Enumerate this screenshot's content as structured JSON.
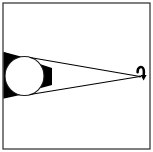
{
  "figure": {
    "frame": {
      "x": 3,
      "y": 3,
      "width": 147,
      "height": 146,
      "stroke": "#2a2a2a",
      "stroke_width": 1.2,
      "fill": "#ffffff"
    },
    "background_color": "#ffffff",
    "ink_color": "#000000"
  },
  "chart_data": {
    "type": "diagram",
    "xlabel": "",
    "ylabel": "",
    "xlim": [
      0,
      153
    ],
    "ylim": [
      0,
      152
    ],
    "grid": false,
    "legend": "none",
    "elements": [
      {
        "name": "umbra-wedge",
        "kind": "filled-polygon",
        "fill": "#000000",
        "description": "Black shadow wedge entering from the left edge, tapering to the right",
        "points": [
          [
            0,
            51
          ],
          [
            52,
            68
          ],
          [
            52,
            85
          ],
          [
            0,
            99
          ]
        ]
      },
      {
        "name": "occluding-circle",
        "kind": "circle",
        "cx": 24.5,
        "cy": 76,
        "r": 19.5,
        "fill": "#ffffff",
        "stroke": "#1a1a1a",
        "stroke_width": 1.1
      },
      {
        "name": "upper-tangent-ray",
        "kind": "line",
        "x1": 30,
        "y1": 57.5,
        "x2": 140,
        "y2": 76.5,
        "stroke": "#000000",
        "stroke_width": 1.1
      },
      {
        "name": "lower-tangent-ray",
        "kind": "line",
        "x1": 30,
        "y1": 94.5,
        "x2": 140,
        "y2": 76.5,
        "stroke": "#000000",
        "stroke_width": 1.1
      },
      {
        "name": "focal-point",
        "kind": "point",
        "cx": 140,
        "cy": 76.5
      },
      {
        "name": "curved-arrow",
        "kind": "curved-arrow",
        "description": "Hook-shaped curved arrow above the focal point, arrowhead pointing down",
        "stroke": "#000000",
        "stroke_width": 2.4,
        "path_start": [
          138.5,
          72.5
        ],
        "path_end": [
          143.5,
          73.5
        ],
        "arrowhead_at": [
          143.5,
          79
        ]
      }
    ]
  }
}
